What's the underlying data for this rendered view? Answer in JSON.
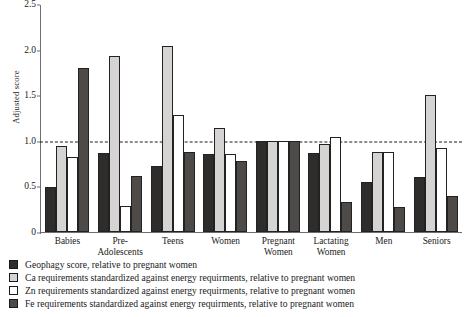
{
  "chart_data": {
    "type": "bar",
    "title": "",
    "xlabel": "",
    "ylabel": "Adjusted score",
    "ylim": [
      0,
      2.5
    ],
    "yticks": [
      0,
      0.5,
      1.0,
      1.5,
      2.0,
      2.5
    ],
    "ytick_labels": [
      "0",
      "0.5",
      "1.0",
      "1.5",
      "2.0",
      "2.5"
    ],
    "grid": false,
    "legend_position": "below-plot",
    "reference_line": {
      "value": 1.0,
      "style": "dashed",
      "color": "#1a1a1a"
    },
    "categories": [
      "Babies",
      "Pre-\nAdolescents",
      "Teens",
      "Women",
      "Pregnant\nWomen",
      "Lactating\nWomen",
      "Men",
      "Seniors"
    ],
    "category_lines": [
      [
        "Babies",
        ""
      ],
      [
        "Pre-",
        "Adolescents"
      ],
      [
        "Teens",
        ""
      ],
      [
        "Women",
        ""
      ],
      [
        "Pregnant",
        "Women"
      ],
      [
        "Lactating",
        "Women"
      ],
      [
        "Men",
        ""
      ],
      [
        "Seniors",
        ""
      ]
    ],
    "series": [
      {
        "name": "Geophagy score, relative to pregnant women",
        "color": "#2f2d2b",
        "values": [
          0.49,
          0.87,
          0.72,
          0.85,
          1.0,
          0.87,
          0.55,
          0.6
        ]
      },
      {
        "name": "Ca requirements standardized against energy requirments, relative to pregnant women",
        "color": "#d6d4d2",
        "values": [
          0.94,
          1.93,
          2.04,
          1.14,
          1.0,
          0.96,
          0.88,
          1.5
        ]
      },
      {
        "name": "Zn requirements standardized against energy requirments, relative to pregnant women",
        "color": "#ffffff",
        "values": [
          0.82,
          0.28,
          1.28,
          0.85,
          1.0,
          1.04,
          0.88,
          0.92
        ]
      },
      {
        "name": "Fe requirements standardized against energy requirments, relative to pregnant women",
        "color": "#4d4a47",
        "values": [
          1.8,
          0.61,
          0.88,
          0.78,
          1.0,
          0.33,
          0.27,
          0.4
        ]
      }
    ]
  }
}
